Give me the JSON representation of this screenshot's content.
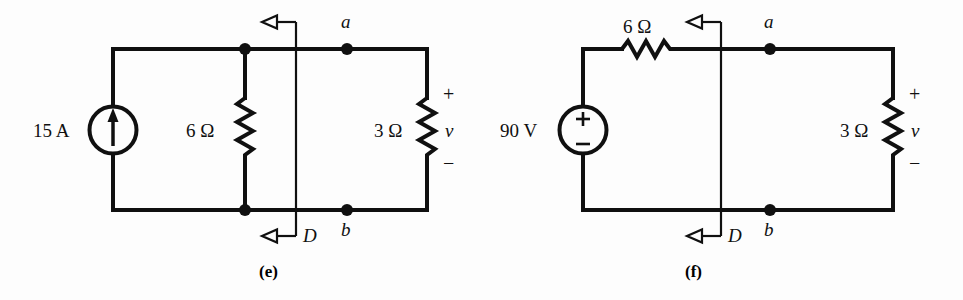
{
  "figure": {
    "background_color": "#fdfdfd",
    "ink_color": "#101010",
    "panels": [
      {
        "id": "e",
        "caption": "(e)",
        "source": {
          "type": "current-source",
          "label": "15 A",
          "symbol": "arrow-up"
        },
        "components": [
          {
            "name": "parallel-resistor",
            "label": "6 Ω",
            "orientation": "vertical"
          },
          {
            "name": "load-resistor",
            "label": "3 Ω",
            "orientation": "vertical"
          }
        ],
        "terminals": {
          "top": "a",
          "bottom": "b"
        },
        "cut_line": {
          "label": "D",
          "top_arrow": "arrow-left-open",
          "bottom_arrow": "arrow-left-open"
        },
        "voltage_polarity": {
          "plus": "+",
          "variable": "v",
          "minus": "−"
        }
      },
      {
        "id": "f",
        "caption": "(f)",
        "source": {
          "type": "voltage-source",
          "label": "90 V",
          "plus": "+",
          "minus": "−"
        },
        "components": [
          {
            "name": "series-resistor",
            "label": "6 Ω",
            "orientation": "horizontal"
          },
          {
            "name": "load-resistor",
            "label": "3 Ω",
            "orientation": "vertical"
          }
        ],
        "terminals": {
          "top": "a",
          "bottom": "b"
        },
        "cut_line": {
          "label": "D",
          "top_arrow": "arrow-left-open",
          "bottom_arrow": "arrow-left-open"
        },
        "voltage_polarity": {
          "plus": "+",
          "variable": "v",
          "minus": "−"
        }
      }
    ]
  }
}
